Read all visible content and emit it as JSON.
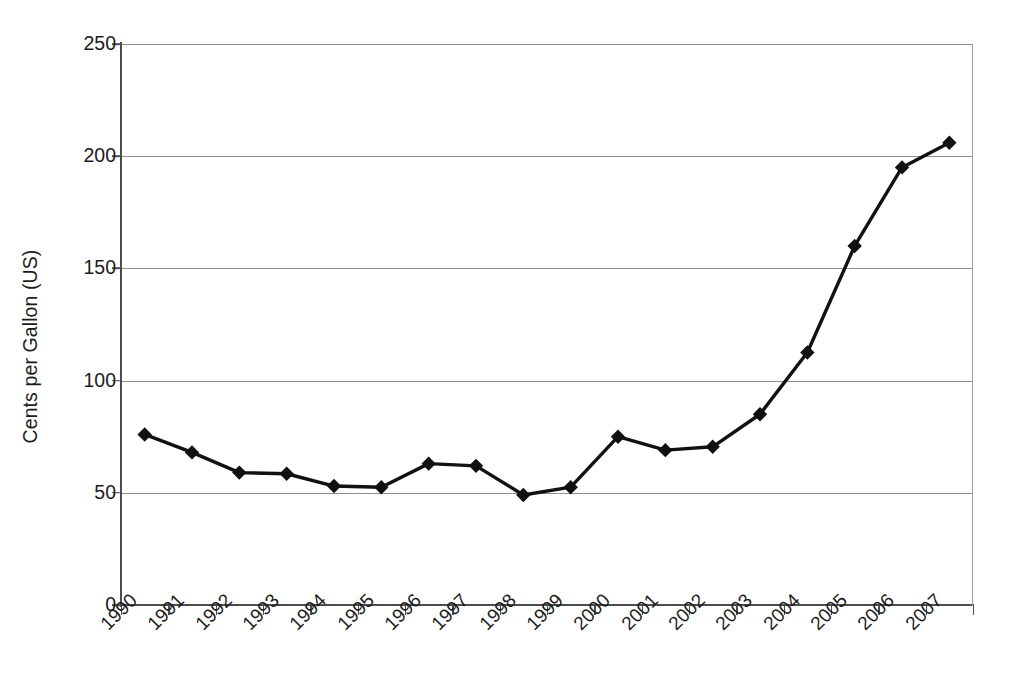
{
  "chart_data": {
    "type": "line",
    "title": "",
    "subtitle": "",
    "xlabel": "",
    "ylabel": "Cents per Gallon (US)",
    "categories": [
      "1990",
      "1991",
      "1992",
      "1993",
      "1994",
      "1995",
      "1996",
      "1997",
      "1998",
      "1999",
      "2000",
      "2001",
      "2002",
      "2003",
      "2004",
      "2005",
      "2006",
      "2007"
    ],
    "values": [
      76,
      68,
      59,
      58.5,
      53,
      52.5,
      63,
      62,
      49,
      52.5,
      75,
      69,
      70.5,
      85,
      112.5,
      160,
      195,
      206
    ],
    "series": [
      {
        "name": "Cents per Gallon (US)",
        "values": [
          76,
          68,
          59,
          58.5,
          53,
          52.5,
          63,
          62,
          49,
          52.5,
          75,
          69,
          70.5,
          85,
          112.5,
          160,
          195,
          206
        ]
      }
    ],
    "ylim": [
      0,
      250
    ],
    "yticks": [
      0,
      50,
      100,
      150,
      200,
      250
    ],
    "ytick_labels": [
      "0",
      "50",
      "100",
      "150",
      "200",
      "250"
    ],
    "grid": "horizontal",
    "legend": "none",
    "marker": "diamond",
    "line_color": "#111111",
    "marker_color": "#111111",
    "gridline_color": "#8e9092",
    "axis_color": "#4a4c4e",
    "background": "#ffffff",
    "xtick_rotation": -45,
    "annotations": []
  }
}
